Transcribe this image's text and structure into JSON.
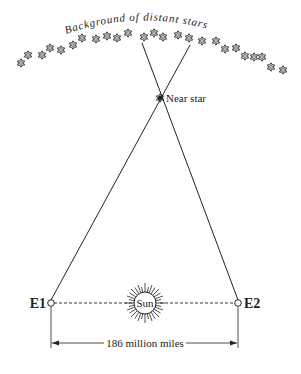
{
  "diagram": {
    "title_arc": "Background of distant stars",
    "near_star_label": "Near star",
    "sun_label": "Sun",
    "earth_left_label": "E1",
    "earth_right_label": "E2",
    "distance_label": "186 million miles",
    "colors": {
      "ink": "#222222",
      "background": "#ffffff"
    },
    "icons": {
      "distant_star": "six-point-star-icon",
      "near_star": "six-point-star-icon",
      "sun": "sun-icon",
      "earth_position": "circle-icon"
    }
  }
}
